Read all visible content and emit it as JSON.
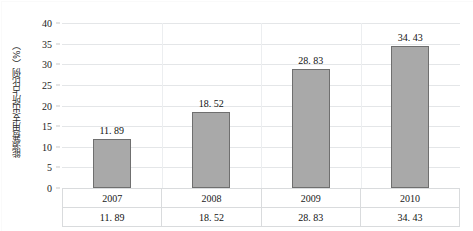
{
  "chart_data": {
    "type": "bar",
    "title": "",
    "xlabel": "",
    "ylabel": "能源费用支出所占比例（%）",
    "categories": [
      "2007",
      "2008",
      "2009",
      "2010"
    ],
    "values": [
      11.89,
      18.52,
      28.83,
      34.43
    ],
    "value_labels": [
      "11. 89",
      "18. 52",
      "28. 83",
      "34. 43"
    ],
    "ylim": [
      0,
      40
    ],
    "ytick_labels": [
      "0",
      "5",
      "10",
      "15",
      "20",
      "25",
      "30",
      "35",
      "40"
    ],
    "ytick_values": [
      0,
      5,
      10,
      15,
      20,
      25,
      30,
      35,
      40
    ],
    "grid": true,
    "legend": false,
    "bar_color": "#a9a9a9",
    "bar_border_color": "#6f6f6f",
    "gridline_color": "#e4e6e8"
  },
  "table": {
    "rows": [
      {
        "name": "years",
        "cells": [
          "2007",
          "2008",
          "2009",
          "2010"
        ]
      },
      {
        "name": "values",
        "cells": [
          "11. 89",
          "18. 52",
          "28. 83",
          "34. 43"
        ]
      }
    ]
  }
}
